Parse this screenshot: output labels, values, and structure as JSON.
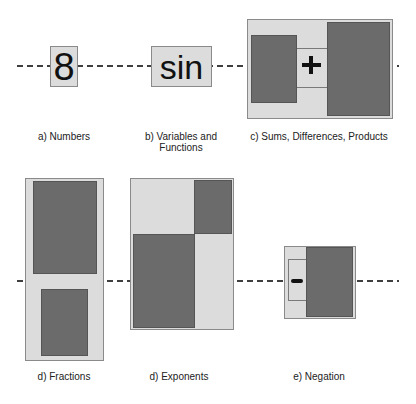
{
  "figure": {
    "panels": [
      {
        "id": "a",
        "caption": "a) Numbers",
        "glyph": "8"
      },
      {
        "id": "b",
        "caption_line1": "b) Variables and",
        "caption_line2": "Functions",
        "glyph": "sin"
      },
      {
        "id": "c",
        "caption": "c) Sums, Differences, Products",
        "glyph": "+"
      },
      {
        "id": "d1",
        "caption": "d) Fractions"
      },
      {
        "id": "d2",
        "caption": "d) Exponents"
      },
      {
        "id": "e",
        "caption": "e) Negation",
        "glyph": "-"
      }
    ]
  },
  "colors": {
    "light_box": "#dcdcdc",
    "dark_box": "#6b6b6b",
    "border": "#8a8a8a",
    "baseline_dash": "#3f3f3f"
  }
}
